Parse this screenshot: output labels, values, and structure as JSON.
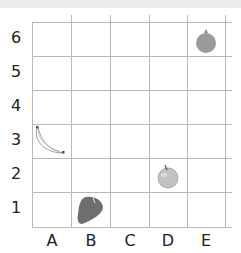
{
  "grid": {
    "columns": [
      "A",
      "B",
      "C",
      "D",
      "E"
    ],
    "rows": [
      "6",
      "5",
      "4",
      "3",
      "2",
      "1"
    ],
    "line_color": "#b8b8b8"
  },
  "items": [
    {
      "name": "pomegranate",
      "column": "E",
      "row": "6",
      "color": "#9a9a9a"
    },
    {
      "name": "banana",
      "column": "A",
      "row": "3",
      "color": "#ffffff"
    },
    {
      "name": "apple",
      "column": "D",
      "row": "2",
      "color": "#c2c2c2"
    },
    {
      "name": "strawberry",
      "column": "B",
      "row": "1",
      "color": "#6e6e6e"
    }
  ]
}
